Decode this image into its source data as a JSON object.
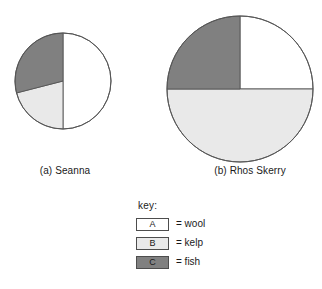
{
  "chart_data": [
    {
      "type": "pie",
      "id": "seanna",
      "title": "(a) Seanna",
      "caption_prefix": "(a)",
      "caption_name": "Seanna",
      "categories": [
        "A",
        "B",
        "C"
      ],
      "labels": [
        "wool",
        "kelp",
        "fish"
      ],
      "values": [
        50,
        21,
        29
      ],
      "units": "percent",
      "colors": [
        "#ffffff",
        "#e9e9e9",
        "#808080"
      ],
      "outline": "#555555",
      "start_angle_deg": 270,
      "direction": "clockwise",
      "radius_px": 48,
      "legend_position": "below",
      "grid": false
    },
    {
      "type": "pie",
      "id": "rhos-skerry",
      "title": "(b) Rhos Skerry",
      "caption_prefix": "(b)",
      "caption_name": "Rhos Skerry",
      "categories": [
        "A",
        "B",
        "C"
      ],
      "labels": [
        "wool",
        "kelp",
        "fish"
      ],
      "values": [
        25,
        50,
        25
      ],
      "units": "percent",
      "colors": [
        "#ffffff",
        "#e9e9e9",
        "#808080"
      ],
      "outline": "#555555",
      "start_angle_deg": 270,
      "direction": "clockwise",
      "radius_px": 73,
      "legend_position": "below",
      "grid": false
    }
  ],
  "charts": [
    {
      "caption": "(a) Seanna"
    },
    {
      "caption": "(b) Rhos Skerry"
    }
  ],
  "legend": {
    "title": "key:",
    "rows": [
      {
        "key": "A",
        "equals": "= wool",
        "color": "#ffffff"
      },
      {
        "key": "B",
        "equals": "= kelp",
        "color": "#e9e9e9"
      },
      {
        "key": "C",
        "equals": "= fish",
        "color": "#808080"
      }
    ]
  },
  "colors": {
    "wool": "#ffffff",
    "kelp": "#e9e9e9",
    "fish": "#808080",
    "outline": "#555555",
    "text": "#1a1a1a"
  }
}
